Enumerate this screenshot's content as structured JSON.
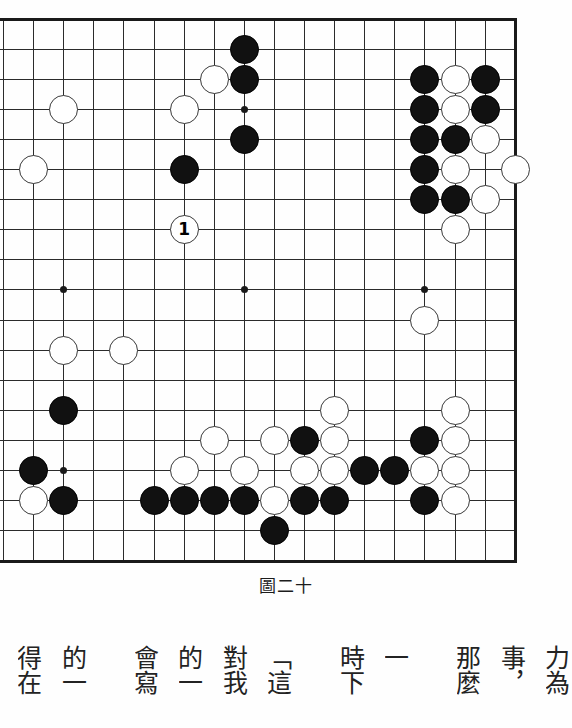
{
  "figure": {
    "caption": "圖二十",
    "board": {
      "type": "go-board-diagram",
      "visible_columns": 18,
      "visible_rows": 19,
      "grid_spacing_px": 30.1,
      "origin_px": [
        3.5,
        19
      ],
      "edges_shown": [
        "top",
        "right",
        "bottom"
      ],
      "star_points": [
        [
          2,
          3
        ],
        [
          8,
          3
        ],
        [
          14,
          3
        ],
        [
          2,
          9
        ],
        [
          8,
          9
        ],
        [
          14,
          9
        ],
        [
          2,
          15
        ],
        [
          8,
          15
        ],
        [
          14,
          15
        ]
      ],
      "colors": {
        "black": "#111111",
        "white": "#ffffff",
        "line": "#2b2b2b",
        "border": "#1a1a1a"
      },
      "move_marker": {
        "label": "1",
        "color": "white",
        "col": 6,
        "row": 7
      },
      "stones": [
        {
          "c": "b",
          "col": 8,
          "row": 1
        },
        {
          "c": "b",
          "col": 8,
          "row": 2
        },
        {
          "c": "w",
          "col": 7,
          "row": 2
        },
        {
          "c": "w",
          "col": 2,
          "row": 3
        },
        {
          "c": "w",
          "col": 6,
          "row": 3
        },
        {
          "c": "b",
          "col": 8,
          "row": 4
        },
        {
          "c": "w",
          "col": 1,
          "row": 5
        },
        {
          "c": "b",
          "col": 6,
          "row": 5
        },
        {
          "c": "w",
          "col": 6,
          "row": 7
        },
        {
          "c": "b",
          "col": 14,
          "row": 2
        },
        {
          "c": "w",
          "col": 15,
          "row": 2
        },
        {
          "c": "b",
          "col": 16,
          "row": 2
        },
        {
          "c": "b",
          "col": 14,
          "row": 3
        },
        {
          "c": "w",
          "col": 15,
          "row": 3
        },
        {
          "c": "b",
          "col": 16,
          "row": 3
        },
        {
          "c": "b",
          "col": 14,
          "row": 4
        },
        {
          "c": "b",
          "col": 15,
          "row": 4
        },
        {
          "c": "w",
          "col": 16,
          "row": 4
        },
        {
          "c": "b",
          "col": 14,
          "row": 5
        },
        {
          "c": "w",
          "col": 15,
          "row": 5
        },
        {
          "c": "w",
          "col": 17,
          "row": 5
        },
        {
          "c": "b",
          "col": 14,
          "row": 6
        },
        {
          "c": "b",
          "col": 15,
          "row": 6
        },
        {
          "c": "w",
          "col": 16,
          "row": 6
        },
        {
          "c": "w",
          "col": 15,
          "row": 7
        },
        {
          "c": "w",
          "col": 14,
          "row": 10
        },
        {
          "c": "w",
          "col": 2,
          "row": 11
        },
        {
          "c": "w",
          "col": 4,
          "row": 11
        },
        {
          "c": "b",
          "col": 2,
          "row": 13
        },
        {
          "c": "w",
          "col": 11,
          "row": 13
        },
        {
          "c": "w",
          "col": 15,
          "row": 13
        },
        {
          "c": "w",
          "col": 7,
          "row": 14
        },
        {
          "c": "w",
          "col": 9,
          "row": 14
        },
        {
          "c": "b",
          "col": 10,
          "row": 14
        },
        {
          "c": "w",
          "col": 11,
          "row": 14
        },
        {
          "c": "b",
          "col": 14,
          "row": 14
        },
        {
          "c": "w",
          "col": 15,
          "row": 14
        },
        {
          "c": "b",
          "col": 1,
          "row": 15
        },
        {
          "c": "w",
          "col": 6,
          "row": 15
        },
        {
          "c": "w",
          "col": 8,
          "row": 15
        },
        {
          "c": "w",
          "col": 10,
          "row": 15
        },
        {
          "c": "w",
          "col": 11,
          "row": 15
        },
        {
          "c": "b",
          "col": 12,
          "row": 15
        },
        {
          "c": "b",
          "col": 13,
          "row": 15
        },
        {
          "c": "w",
          "col": 14,
          "row": 15
        },
        {
          "c": "w",
          "col": 15,
          "row": 15
        },
        {
          "c": "w",
          "col": 1,
          "row": 16
        },
        {
          "c": "b",
          "col": 2,
          "row": 16
        },
        {
          "c": "b",
          "col": 5,
          "row": 16
        },
        {
          "c": "b",
          "col": 6,
          "row": 16
        },
        {
          "c": "b",
          "col": 7,
          "row": 16
        },
        {
          "c": "b",
          "col": 8,
          "row": 16
        },
        {
          "c": "w",
          "col": 9,
          "row": 16
        },
        {
          "c": "b",
          "col": 10,
          "row": 16
        },
        {
          "c": "b",
          "col": 11,
          "row": 16
        },
        {
          "c": "b",
          "col": 14,
          "row": 16
        },
        {
          "c": "w",
          "col": 15,
          "row": 16
        },
        {
          "c": "b",
          "col": 9,
          "row": 17
        }
      ]
    }
  },
  "body_text": {
    "note": "vertical CJK columns, right to left; clipped at both edges of the page",
    "columns": [
      {
        "text": "力為",
        "clipped": "right"
      },
      {
        "text": "事，"
      },
      {
        "text": "那麼"
      },
      {
        "text": "一"
      },
      {
        "text": "時下"
      },
      {
        "text": "「這"
      },
      {
        "text": "對我"
      },
      {
        "text": "的一"
      },
      {
        "text": "會寫"
      },
      {
        "text": "的一"
      },
      {
        "text": "得在",
        "clipped": "left"
      }
    ]
  }
}
